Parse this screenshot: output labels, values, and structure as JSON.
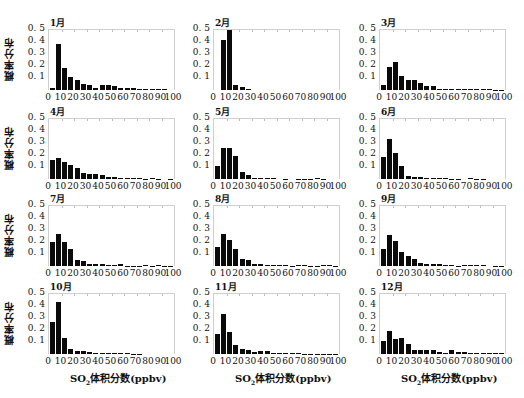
{
  "chart_data": {
    "type": "bar",
    "layout": "4x3 grid of histograms",
    "ylabel": "概率分布",
    "xlabel": "SO2体积分数(ppbv)",
    "xticks": [
      "0",
      "10",
      "20",
      "30",
      "40",
      "50",
      "60",
      "70",
      "80",
      "90",
      "100"
    ],
    "yticks": [
      "0.1",
      "0.2",
      "0.3",
      "0.4",
      "0.5"
    ],
    "ylim": [
      0,
      0.5
    ],
    "xlim": [
      0,
      100
    ],
    "bin_width": 5,
    "bin_starts": [
      0,
      5,
      10,
      15,
      20,
      25,
      30,
      35,
      40,
      45,
      50,
      55,
      60,
      65,
      70,
      75,
      80,
      85,
      90,
      95
    ],
    "panels": [
      {
        "title": "1月",
        "values": [
          0.02,
          0.38,
          0.18,
          0.11,
          0.08,
          0.05,
          0.045,
          0.02,
          0.045,
          0.04,
          0.03,
          0.015,
          0.015,
          0.015,
          0.01,
          0.005,
          0.005,
          0.005,
          0.005,
          0.0
        ]
      },
      {
        "title": "2月",
        "values": [
          0.0,
          0.42,
          0.5,
          0.04,
          0.025,
          0.01,
          0.0,
          0.0,
          0.0,
          0.0,
          0.0,
          0.0,
          0.0,
          0.0,
          0.0,
          0.0,
          0.0,
          0.0,
          0.0,
          0.0
        ]
      },
      {
        "title": "3月",
        "values": [
          0.045,
          0.19,
          0.23,
          0.12,
          0.085,
          0.08,
          0.06,
          0.03,
          0.03,
          0.01,
          0.01,
          0.01,
          0.01,
          0.008,
          0.008,
          0.008,
          0.005,
          0.005,
          0.003,
          0.003
        ]
      },
      {
        "title": "4月",
        "values": [
          0.155,
          0.175,
          0.145,
          0.12,
          0.095,
          0.05,
          0.045,
          0.04,
          0.03,
          0.015,
          0.015,
          0.01,
          0.012,
          0.005,
          0.005,
          0.003,
          0.008,
          0.003,
          0.0,
          0.003
        ]
      },
      {
        "title": "5月",
        "values": [
          0.11,
          0.26,
          0.255,
          0.19,
          0.06,
          0.03,
          0.01,
          0.01,
          0.01,
          0.012,
          0.0,
          0.003,
          0.0,
          0.003,
          0.003,
          0.003,
          0.005,
          0.003,
          0.0,
          0.0
        ]
      },
      {
        "title": "6月",
        "values": [
          0.18,
          0.33,
          0.22,
          0.11,
          0.025,
          0.02,
          0.015,
          0.01,
          0.01,
          0.005,
          0.005,
          0.003,
          0.003,
          0.0,
          0.005,
          0.003,
          0.003,
          0.0,
          0.0,
          0.0
        ]
      },
      {
        "title": "7月",
        "values": [
          0.2,
          0.265,
          0.2,
          0.145,
          0.05,
          0.045,
          0.02,
          0.02,
          0.015,
          0.01,
          0.01,
          0.015,
          0.003,
          0.003,
          0.003,
          0.005,
          0.003,
          0.008,
          0.003,
          0.003
        ]
      },
      {
        "title": "8月",
        "values": [
          0.16,
          0.27,
          0.22,
          0.14,
          0.06,
          0.05,
          0.02,
          0.015,
          0.01,
          0.005,
          0.005,
          0.008,
          0.003,
          0.005,
          0.005,
          0.003,
          0.003,
          0.005,
          0.005,
          0.003
        ]
      },
      {
        "title": "9月",
        "values": [
          0.14,
          0.26,
          0.21,
          0.115,
          0.08,
          0.06,
          0.025,
          0.02,
          0.015,
          0.02,
          0.01,
          0.008,
          0.003,
          0.005,
          0.008,
          0.005,
          0.005,
          0.0,
          0.003,
          0.003
        ]
      },
      {
        "title": "10月",
        "values": [
          0.27,
          0.43,
          0.13,
          0.04,
          0.028,
          0.028,
          0.02,
          0.01,
          0.01,
          0.01,
          0.012,
          0.005,
          0.005,
          0.003,
          0.003,
          0.0,
          0.0,
          0.0,
          0.0,
          0.0
        ]
      },
      {
        "title": "11月",
        "values": [
          0.17,
          0.335,
          0.185,
          0.075,
          0.04,
          0.03,
          0.02,
          0.025,
          0.025,
          0.012,
          0.012,
          0.008,
          0.008,
          0.005,
          0.003,
          0.003,
          0.003,
          0.003,
          0.003,
          0.003
        ]
      },
      {
        "title": "12月",
        "values": [
          0.11,
          0.195,
          0.125,
          0.135,
          0.08,
          0.03,
          0.03,
          0.03,
          0.03,
          0.015,
          0.008,
          0.03,
          0.015,
          0.015,
          0.012,
          0.008,
          0.008,
          0.005,
          0.01,
          0.008
        ]
      }
    ]
  },
  "labels": {
    "ylabel": "概率分布",
    "xlabel_prefix": "SO",
    "xlabel_sub": "2",
    "xlabel_suffix": "体积分数(ppbv)"
  }
}
